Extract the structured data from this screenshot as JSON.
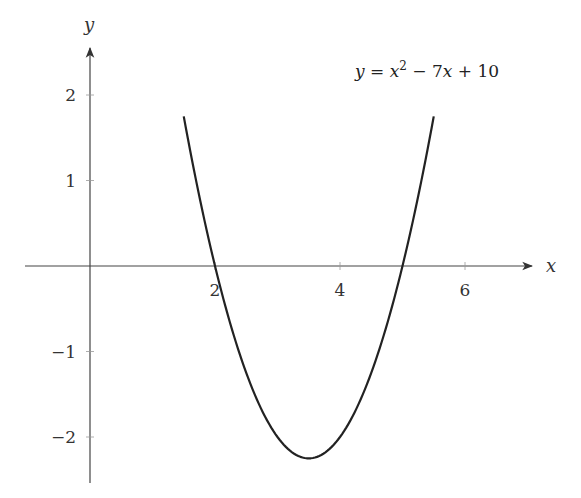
{
  "chart_data": {
    "type": "line",
    "title": "",
    "xlabel": "x",
    "ylabel": "y",
    "function": "x^2 - 7x + 10",
    "series": [
      {
        "name": "y = x^2 - 7x + 10",
        "label_parts": [
          "y",
          " = ",
          "x",
          "2",
          " − 7",
          "x",
          " + 10"
        ],
        "x_range": [
          1.5,
          5.5
        ],
        "x": [
          1.5,
          2,
          2.5,
          3,
          3.5,
          4,
          4.5,
          5,
          5.5
        ],
        "y": [
          1.75,
          0,
          -1.25,
          -2,
          -2.25,
          -2,
          -1.25,
          0,
          1.75
        ],
        "color": "#222222"
      }
    ],
    "x_ticks": [
      2,
      4,
      6
    ],
    "x_tick_labels": [
      "2",
      "4",
      "6"
    ],
    "y_ticks": [
      -2,
      -1,
      1,
      2
    ],
    "y_tick_labels": [
      "−2",
      "−1",
      "1",
      "2"
    ],
    "xlim": [
      -2.1,
      7.0
    ],
    "ylim": [
      -2.5,
      2.55
    ],
    "grid": false,
    "legend": "none",
    "annotations": [
      {
        "text": "y = x^2 - 7x + 10",
        "position": "upper right, near curve"
      }
    ],
    "roots": [
      2,
      5
    ],
    "vertex": [
      3.5,
      -2.25
    ]
  },
  "axes": {
    "x_label": "x",
    "y_label": "y"
  }
}
